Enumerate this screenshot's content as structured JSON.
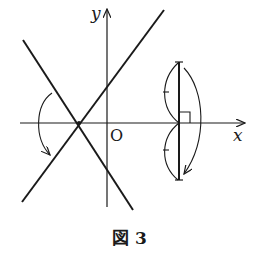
{
  "figure": {
    "caption": "図 3",
    "axis_labels": {
      "x": "x",
      "y": "y",
      "origin": "O"
    },
    "colors": {
      "ink": "#1a1a1a",
      "background": "#ffffff"
    }
  }
}
